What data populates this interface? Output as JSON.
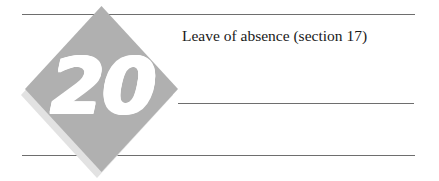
{
  "page": {
    "background_color": "#ffffff",
    "width": 439,
    "height": 181
  },
  "badge": {
    "shape": "diamond",
    "number": "20",
    "fill_color": "#b0b0b0",
    "shadow_color": "#e2e2e2",
    "number_color": "#ffffff"
  },
  "heading": {
    "text": "Leave of absence (section 17)",
    "color": "#1a1a1a"
  },
  "rules": {
    "color": "#6e6e6e",
    "top": "",
    "middle": "",
    "bottom": ""
  }
}
